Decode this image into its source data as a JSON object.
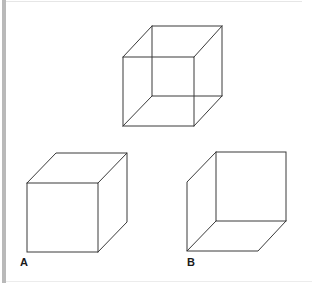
{
  "figure": {
    "stroke_color": "#3a3a3a",
    "border_color": "#b9b9b9",
    "cubes": {
      "top": {
        "name": "necker-cube",
        "front": {
          "x1": 123,
          "y1": 57,
          "x2": 194,
          "y2": 126
        },
        "back": {
          "x1": 152,
          "y1": 26,
          "x2": 222,
          "y2": 96
        }
      },
      "a": {
        "name": "cube-a",
        "label": "A",
        "front": {
          "x1": 27,
          "y1": 183,
          "x2": 98,
          "y2": 252
        },
        "back": {
          "x1": 56,
          "y1": 153,
          "x2": 127,
          "y2": 222
        }
      },
      "b": {
        "name": "cube-b",
        "label": "B",
        "front": {
          "x1": 187,
          "y1": 182,
          "x2": 258,
          "y2": 251
        },
        "back": {
          "x1": 216,
          "y1": 152,
          "x2": 286,
          "y2": 221
        }
      }
    }
  }
}
